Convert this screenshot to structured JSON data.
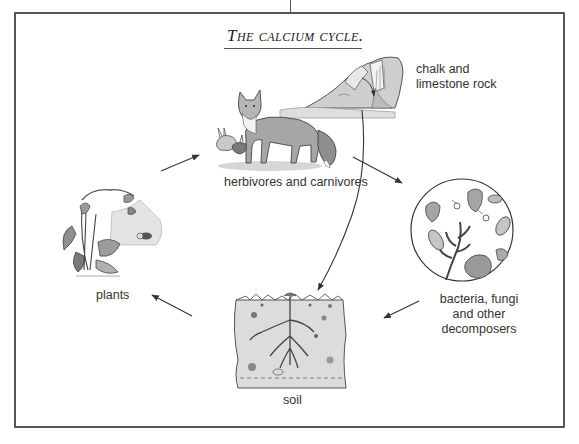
{
  "diagram": {
    "title": "The calcium cycle.",
    "nodes": [
      {
        "id": "herbivores",
        "label": "herbivores and carnivores",
        "icon": "fox-rabbit-illustration"
      },
      {
        "id": "rock",
        "label_line1": "chalk and",
        "label_line2": "limestone rock",
        "icon": "rock-waterfall-illustration"
      },
      {
        "id": "decomposers",
        "label_line1": "bacteria, fungi",
        "label_line2": "and other",
        "label_line3": "decomposers",
        "icon": "microscope-circle-illustration"
      },
      {
        "id": "soil",
        "label": "soil",
        "icon": "soil-cross-section-illustration"
      },
      {
        "id": "plants",
        "label": "plants",
        "icon": "plant-illustration"
      }
    ],
    "edges": [
      {
        "from": "plants",
        "to": "herbivores"
      },
      {
        "from": "herbivores",
        "to": "decomposers"
      },
      {
        "from": "decomposers",
        "to": "soil"
      },
      {
        "from": "soil",
        "to": "plants"
      },
      {
        "from": "rock",
        "to": "soil"
      }
    ],
    "colors": {
      "line": "#444444",
      "fill_light": "#d9d9d9",
      "fill_mid": "#a8a8a8",
      "fill_dark": "#666666"
    }
  }
}
